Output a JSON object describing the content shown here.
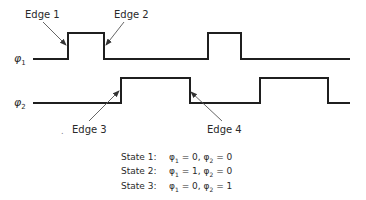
{
  "signals": [
    {
      "name": "phi1",
      "label_symbol": "φ",
      "label_sub": "1",
      "baseline_y": 59,
      "high_y": 33,
      "x_start": 33,
      "x_end": 350,
      "pulses": [
        {
          "rise": 68,
          "fall": 104
        },
        {
          "rise": 208,
          "fall": 241
        }
      ]
    },
    {
      "name": "phi2",
      "label_symbol": "φ",
      "label_sub": "2",
      "baseline_y": 103,
      "high_y": 78,
      "x_start": 33,
      "x_end": 350,
      "pulses": [
        {
          "rise": 121,
          "fall": 190
        },
        {
          "rise": 260,
          "fall": 328
        }
      ]
    }
  ],
  "edges": [
    {
      "label": "Edge 1",
      "label_x": 25,
      "label_y": 9,
      "from": [
        43,
        22
      ],
      "to": [
        66,
        45
      ]
    },
    {
      "label": "Edge 2",
      "label_x": 114,
      "label_y": 9,
      "from": [
        124,
        22
      ],
      "to": [
        106,
        45
      ]
    },
    {
      "label": "Edge 3",
      "label_x": 72,
      "label_y": 124,
      "from": [
        89,
        121
      ],
      "to": [
        119,
        91
      ]
    },
    {
      "label": "Edge 4",
      "label_x": 207,
      "label_y": 124,
      "from": [
        222,
        121
      ],
      "to": [
        191,
        92
      ]
    }
  ],
  "states": [
    {
      "name": "State 1:",
      "phi1": "0",
      "phi2": "0"
    },
    {
      "name": "State 2:",
      "phi1": "1",
      "phi2": "0"
    },
    {
      "name": "State 3:",
      "phi1": "0",
      "phi2": "1"
    }
  ],
  "colors": {
    "line": "#1f1f1f",
    "arrow": "#555555",
    "text": "#2a2a2a"
  }
}
